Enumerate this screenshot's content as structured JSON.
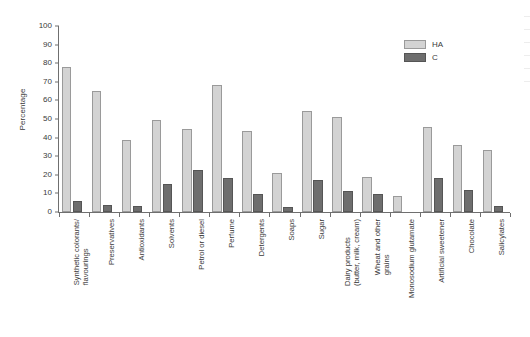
{
  "chart_data": {
    "type": "bar",
    "title": "",
    "xlabel": "",
    "ylabel": "Percentage",
    "ylim": [
      0,
      100
    ],
    "ytick_step": 10,
    "yticks": [
      100,
      90,
      80,
      70,
      60,
      50,
      40,
      30,
      20,
      10,
      0
    ],
    "grid": false,
    "legend_position": "top-right",
    "categories": [
      "Synthetic colorants/ flavourings",
      "Preservatives",
      "Antioxidants",
      "Solvents",
      "Petrol or diesel",
      "Perfume",
      "Detergents",
      "Soaps",
      "Sugar",
      "Dairy products (butter, milk, cream)",
      "Wheat and other grains",
      "Monosodium glutamate",
      "Artificial sweetener",
      "Chocolate",
      "Salicylates"
    ],
    "series": [
      {
        "name": "HA",
        "color": "#d3d3d3",
        "values": [
          78,
          65,
          38.5,
          49.5,
          44.5,
          68.5,
          43.5,
          21,
          54.5,
          51,
          19,
          8.5,
          45.5,
          36,
          33.5
        ]
      },
      {
        "name": "C",
        "color": "#6e6e6e",
        "values": [
          6,
          4,
          3,
          15,
          22.5,
          18.5,
          9.5,
          2.5,
          17,
          11.5,
          9.5,
          0,
          18.5,
          12,
          3.5
        ]
      }
    ]
  },
  "legend": {
    "items": [
      {
        "label": "HA"
      },
      {
        "label": "C"
      }
    ]
  }
}
